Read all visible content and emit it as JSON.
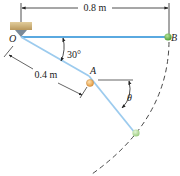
{
  "figure": {
    "type": "mechanics-diagram",
    "points": {
      "O": "O",
      "A": "A",
      "B": "B"
    },
    "dimensions": {
      "OB_length": "0.8 m",
      "OA_length": "0.4 m"
    },
    "angles": {
      "rod_angle": "30°",
      "theta": "θ"
    },
    "colors": {
      "rod": "#5aa9e0",
      "rod_light": "#a9d3f0",
      "ball_B": "#6ab04c",
      "ball_lower": "#a8d88a",
      "ball_A": "#f0b060",
      "support": "#c9ad78",
      "pivot": "#7a8a99",
      "dimension_line": "#222222"
    }
  }
}
